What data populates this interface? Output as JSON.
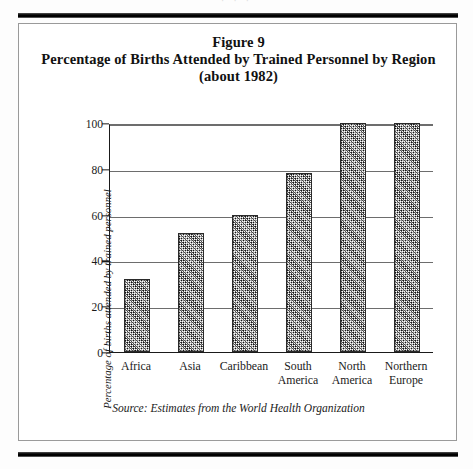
{
  "document": {
    "top_sliver_text": "· · ·",
    "figure_number": "Figure 9",
    "title_line2": "Percentage of Births Attended by Trained Personnel by Region",
    "title_line3": "(about 1982)",
    "source_note": "Source: Estimates from the World Health Organization"
  },
  "chart_data": {
    "type": "bar",
    "title": "Percentage of Births Attended by Trained Personnel by Region (about 1982)",
    "categories": [
      "Africa",
      "Asia",
      "Caribbean",
      "South America",
      "North America",
      "Northern Europe"
    ],
    "category_lines": [
      [
        "Africa"
      ],
      [
        "Asia"
      ],
      [
        "Caribbean"
      ],
      [
        "South",
        "America"
      ],
      [
        "North",
        "America"
      ],
      [
        "Northern",
        "Europe"
      ]
    ],
    "values": [
      32,
      52,
      60,
      78,
      100,
      100
    ],
    "xlabel": "",
    "ylabel": "Percentage of births attended by trained personnel",
    "ylim": [
      0,
      100
    ],
    "yticks": [
      0,
      20,
      40,
      60,
      80,
      100
    ],
    "ytick_labels": [
      "0",
      "20",
      "40",
      "60",
      "80",
      "100"
    ],
    "grid": true,
    "legend": "none",
    "bar_fill": "crosshatch-dither",
    "colors": {
      "bar_fill": "#9a9a9a",
      "bar_border": "#2a2a2a",
      "gridline": "#6d6d6d",
      "axis": "#1a1a1a",
      "background": "#ffffff"
    }
  }
}
